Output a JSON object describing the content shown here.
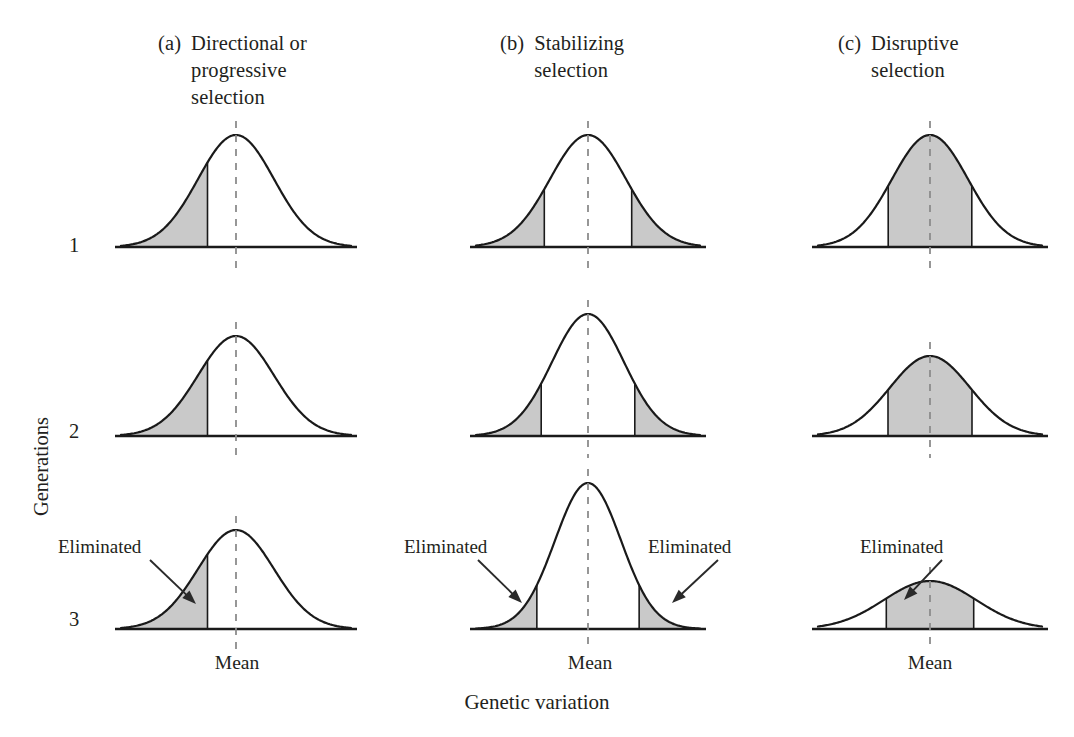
{
  "figure": {
    "y_axis_label": "Generations",
    "x_axis_label": "Genetic variation",
    "mean_label": "Mean",
    "eliminated_label": "Eliminated",
    "generation_numbers": [
      "1",
      "2",
      "3"
    ],
    "shade_color": "#c9c9c9",
    "curve_color": "#1a1a1a",
    "mean_line_color": "#8c8c8c",
    "background_color": "#ffffff"
  },
  "columns": [
    {
      "tag": "(a)",
      "title": "Directional or\nprogressive\nselection",
      "name": "directional-selection"
    },
    {
      "tag": "(b)",
      "title": "Stabilizing\nselection",
      "name": "stabilizing-selection"
    },
    {
      "tag": "(c)",
      "title": "Disruptive\nselection",
      "name": "disruptive-selection"
    }
  ],
  "mean_labels": [
    "Mean",
    "Mean",
    "Mean"
  ],
  "eliminated_labels": [
    "Eliminated",
    "Eliminated",
    "Eliminated",
    "Eliminated"
  ],
  "chart_data": {
    "type": "line",
    "xlabel": "Genetic variation",
    "ylabel": "Generations",
    "grid": false,
    "legend": "none",
    "panels": [
      {
        "column": "(a) Directional or progressive selection",
        "generation": 1,
        "baseline_y": 247,
        "center_x": 236,
        "half_width": 115,
        "peak_height": 112,
        "sigma": 38,
        "shaded": [
          {
            "from": -2.8,
            "to": -0.75,
            "side": "left-tail"
          }
        ]
      },
      {
        "column": "(a) Directional or progressive selection",
        "generation": 2,
        "baseline_y": 436,
        "center_x": 236,
        "half_width": 115,
        "peak_height": 100,
        "sigma": 38,
        "shaded": [
          {
            "from": -2.8,
            "to": -0.75,
            "side": "left-tail"
          }
        ]
      },
      {
        "column": "(a) Directional or progressive selection",
        "generation": 3,
        "baseline_y": 629,
        "center_x": 236,
        "half_width": 115,
        "peak_height": 99,
        "sigma": 38,
        "shaded": [
          {
            "from": -2.8,
            "to": -0.75,
            "side": "left-tail"
          }
        ]
      },
      {
        "column": "(b) Stabilizing selection",
        "generation": 1,
        "baseline_y": 247,
        "center_x": 588,
        "half_width": 112,
        "peak_height": 112,
        "sigma": 38,
        "shaded": [
          {
            "from": -2.8,
            "to": -1.15,
            "side": "left-tail"
          },
          {
            "from": 1.15,
            "to": 2.8,
            "side": "right-tail"
          }
        ]
      },
      {
        "column": "(b) Stabilizing selection",
        "generation": 2,
        "baseline_y": 436,
        "center_x": 588,
        "half_width": 112,
        "peak_height": 122,
        "sigma": 36,
        "shaded": [
          {
            "from": -2.9,
            "to": -1.3,
            "side": "left-tail"
          },
          {
            "from": 1.3,
            "to": 2.9,
            "side": "right-tail"
          }
        ]
      },
      {
        "column": "(b) Stabilizing selection",
        "generation": 3,
        "baseline_y": 629,
        "center_x": 588,
        "half_width": 112,
        "peak_height": 146,
        "sigma": 33,
        "shaded": [
          {
            "from": -3.1,
            "to": -1.55,
            "side": "left-tail"
          },
          {
            "from": 1.55,
            "to": 3.1,
            "side": "right-tail"
          }
        ]
      },
      {
        "column": "(c) Disruptive selection",
        "generation": 1,
        "baseline_y": 247,
        "center_x": 930,
        "half_width": 112,
        "peak_height": 112,
        "sigma": 38,
        "shaded": [
          {
            "from": -1.1,
            "to": 1.1,
            "side": "center-band"
          }
        ]
      },
      {
        "column": "(c) Disruptive selection",
        "generation": 2,
        "baseline_y": 436,
        "center_x": 930,
        "half_width": 112,
        "peak_height": 80,
        "sigma": 40,
        "shaded": [
          {
            "from": -1.05,
            "to": 1.05,
            "side": "center-band"
          }
        ]
      },
      {
        "column": "(c) Disruptive selection",
        "generation": 3,
        "baseline_y": 629,
        "center_x": 930,
        "half_width": 112,
        "peak_height": 48,
        "sigma": 46,
        "shaded": [
          {
            "from": -0.95,
            "to": 0.95,
            "side": "center-band"
          }
        ]
      }
    ],
    "annotations": [
      {
        "text": "Eliminated",
        "panel": "(a) gen 3",
        "arrow_from": [
          150,
          560
        ],
        "arrow_to": [
          196,
          604
        ]
      },
      {
        "text": "Eliminated",
        "panel": "(b) gen 3 left",
        "arrow_from": [
          478,
          560
        ],
        "arrow_to": [
          522,
          603
        ]
      },
      {
        "text": "Eliminated",
        "panel": "(b) gen 3 right",
        "arrow_from": [
          718,
          560
        ],
        "arrow_to": [
          672,
          603
        ]
      },
      {
        "text": "Eliminated",
        "panel": "(c) gen 3",
        "arrow_from": [
          942,
          560
        ],
        "arrow_to": [
          904,
          600
        ]
      }
    ]
  }
}
